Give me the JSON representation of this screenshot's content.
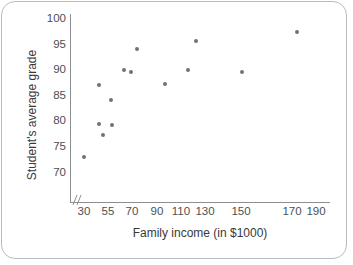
{
  "chart_data": {
    "type": "scatter",
    "title": "",
    "xlabel": "Family income (in $1000)",
    "ylabel": "Student's average grade",
    "x_tick_labels": [
      "30",
      "55",
      "70",
      "90",
      "110",
      "130",
      "150",
      "170",
      "190"
    ],
    "y_tick_labels": [
      "70",
      "75",
      "80",
      "85",
      "90",
      "95",
      "100"
    ],
    "xlim": [
      30,
      190
    ],
    "ylim": [
      68,
      100
    ],
    "grid": false,
    "legend": null,
    "axis_break": "x-axis broken between origin and 30",
    "marker": {
      "shape": "circle",
      "color": "#6e7376",
      "size_px": 4
    },
    "n_points": 14,
    "points": [
      {
        "x": 30,
        "y": 73.6
      },
      {
        "x": 41,
        "y": 87.0
      },
      {
        "x": 41,
        "y": 80.5
      },
      {
        "x": 44,
        "y": 78.0
      },
      {
        "x": 48,
        "y": 84.8
      },
      {
        "x": 48,
        "y": 79.4
      },
      {
        "x": 62,
        "y": 90.2
      },
      {
        "x": 67,
        "y": 89.4
      },
      {
        "x": 70,
        "y": 95.0
      },
      {
        "x": 90,
        "y": 84.4
      },
      {
        "x": 100,
        "y": 90.2
      },
      {
        "x": 110,
        "y": 98.0
      },
      {
        "x": 143,
        "y": 89.5
      },
      {
        "x": 175,
        "y": 98.6
      }
    ],
    "pixel_points": [
      {
        "px": 84,
        "py": 157
      },
      {
        "px": 99,
        "py": 85
      },
      {
        "px": 99,
        "py": 124
      },
      {
        "px": 103,
        "py": 135
      },
      {
        "px": 111,
        "py": 100
      },
      {
        "px": 112,
        "py": 125
      },
      {
        "px": 124,
        "py": 70
      },
      {
        "px": 131,
        "py": 72
      },
      {
        "px": 137,
        "py": 49
      },
      {
        "px": 165,
        "py": 84
      },
      {
        "px": 188,
        "py": 70
      },
      {
        "px": 196,
        "py": 41
      },
      {
        "px": 242,
        "py": 72
      },
      {
        "px": 297,
        "py": 32
      }
    ],
    "y_tick_pixels": [
      173,
      147,
      121,
      96,
      70,
      45,
      19
    ],
    "x_tick_pixels": [
      84,
      108,
      132,
      157,
      181,
      205,
      241,
      292,
      316
    ]
  }
}
